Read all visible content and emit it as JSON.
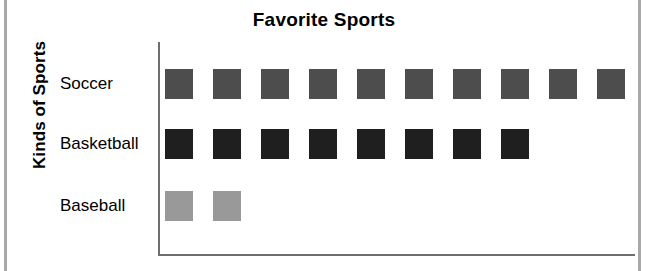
{
  "chart_data": {
    "type": "bar",
    "subtype": "pictograph-horizontal",
    "title": "Favorite Sports",
    "xlabel": "",
    "ylabel": "Kinds of Sports",
    "categories": [
      "Soccer",
      "Basketball",
      "Baseball"
    ],
    "values": [
      10,
      8,
      2
    ],
    "series": [
      {
        "name": "Favorite Sports",
        "values": [
          10,
          8,
          2
        ]
      }
    ],
    "rows": [
      {
        "label": "Soccer",
        "count": 10,
        "color": "#4d4d4d"
      },
      {
        "label": "Basketball",
        "count": 8,
        "color": "#1f1f1f"
      },
      {
        "label": "Baseball",
        "count": 2,
        "color": "#999999"
      }
    ],
    "xlim": [
      0,
      10
    ],
    "grid": false,
    "legend": false,
    "axis_color": "#6e6e6e"
  },
  "page": {
    "edge_color": "#a8a8a8"
  }
}
